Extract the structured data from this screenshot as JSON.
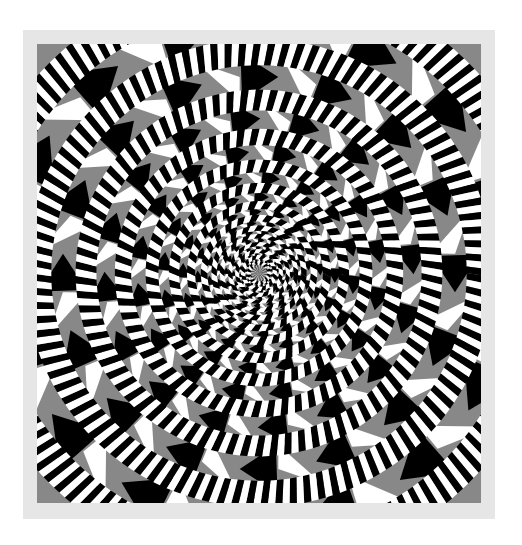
{
  "image": {
    "subject": "Fraser spiral illusion",
    "description": "Concentric circles of twisted black-and-white cord over a gray, black and white checkered background, appearing as a spiral",
    "center": [
      222,
      229
    ],
    "ring_radii": [
      10,
      16,
      22,
      29,
      37,
      45,
      55,
      68,
      85,
      107,
      136,
      173,
      221,
      280
    ],
    "segments_per_ring": 32,
    "cord_twist_deg": 12,
    "colors": {
      "frame": "#e6e6e6",
      "gray": "#888888",
      "black": "#000000",
      "white": "#ffffff",
      "page": "#ffffff"
    }
  }
}
